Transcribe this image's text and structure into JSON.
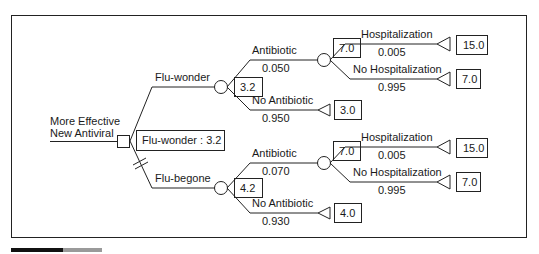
{
  "diagram": {
    "type": "decision-tree",
    "root": {
      "label_line1": "More Effective",
      "label_line2": "New Antiviral",
      "node_type": "decision",
      "result": "Flu-wonder : 3.2"
    },
    "branches": [
      {
        "label": "Flu-wonder",
        "value": "3.2",
        "node_type": "chance",
        "selected": true,
        "children": [
          {
            "label": "Antibiotic",
            "prob": "0.050",
            "value": "7.0",
            "node_type": "chance",
            "children": [
              {
                "label": "Hospitalization",
                "prob": "0.005",
                "payoff": "15.0"
              },
              {
                "label": "No Hospitalization",
                "prob": "0.995",
                "payoff": "7.0"
              }
            ]
          },
          {
            "label": "No Antibiotic",
            "prob": "0.950",
            "payoff": "3.0"
          }
        ]
      },
      {
        "label": "Flu-begone",
        "value": "4.2",
        "node_type": "chance",
        "selected": false,
        "pruned": true,
        "children": [
          {
            "label": "Antibiotic",
            "prob": "0.070",
            "value": "7.0",
            "node_type": "chance",
            "children": [
              {
                "label": "Hospitalization",
                "prob": "0.005",
                "payoff": "15.0"
              },
              {
                "label": "No Hospitalization",
                "prob": "0.995",
                "payoff": "7.0"
              }
            ]
          },
          {
            "label": "No Antibiotic",
            "prob": "0.930",
            "payoff": "4.0"
          }
        ]
      }
    ]
  }
}
